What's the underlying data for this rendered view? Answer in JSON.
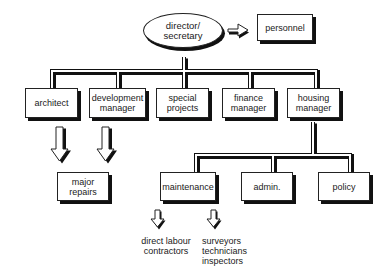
{
  "diagram": {
    "type": "organisation chart",
    "root": {
      "label": "director/\nsecretary"
    },
    "side": {
      "label": "personnel"
    },
    "level1": [
      {
        "label": "architect"
      },
      {
        "label": "development\nmanager"
      },
      {
        "label": "special\nprojects"
      },
      {
        "label": "finance\nmanager"
      },
      {
        "label": "housing\nmanager"
      }
    ],
    "major_repairs": {
      "label": "major\nrepairs"
    },
    "level2": [
      {
        "label": "maintenance"
      },
      {
        "label": "admin."
      },
      {
        "label": "policy"
      }
    ],
    "outputs": [
      {
        "label": "direct labour\ncontractors"
      },
      {
        "label": "surveyors\ntechnicians\ninspectors"
      }
    ]
  }
}
